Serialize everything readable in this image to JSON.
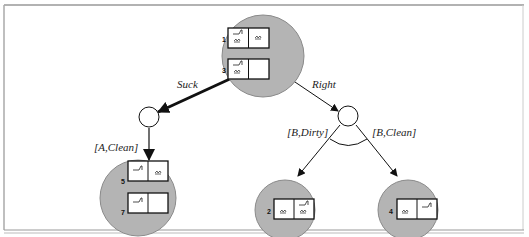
{
  "diagram": {
    "type": "and-or search tree (vacuum world)",
    "root": {
      "states": [
        "1",
        "3"
      ]
    },
    "actions": [
      {
        "label": "Suck",
        "outcomes": [
          {
            "label": "[A,Clean]",
            "states": [
              "5",
              "7"
            ]
          }
        ]
      },
      {
        "label": "Right",
        "outcomes": [
          {
            "label": "[B,Dirty]",
            "states": [
              "2"
            ]
          },
          {
            "label": "[B,Clean]",
            "states": [
              "4"
            ]
          }
        ]
      }
    ],
    "labels": {
      "suck": "Suck",
      "right": "Right",
      "a_clean": "[A,Clean]",
      "b_dirty": "[B,Dirty]",
      "b_clean": "[B,Clean]"
    },
    "state_numbers": {
      "s1": "1",
      "s3": "3",
      "s5": "5",
      "s7": "7",
      "s2": "2",
      "s4": "4"
    },
    "colors": {
      "node_fill": "#b4b4b4",
      "node_stroke": "#8a8a8a",
      "edge": "#111111",
      "frame": "#999999"
    }
  }
}
